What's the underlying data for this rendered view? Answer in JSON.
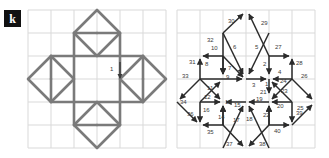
{
  "panel": {
    "label": "k"
  },
  "colors": {
    "grid_line": "#d9d9d9",
    "pattern_stroke": "#7a7a7a",
    "arrow_stroke": "#2b2b2b",
    "label_text": "#3a3a3a",
    "panel_badge_bg": "#111111",
    "panel_badge_text": "#ffffff",
    "background": "#ffffff"
  },
  "left_figure": {
    "name": "octagram-rosette-pattern",
    "description": "Eight-pointed star rosette drawn on a six-by-six square grid",
    "grid": {
      "cols": 6,
      "rows": 6,
      "cell_px": 23,
      "origin_x": 28,
      "origin_y": 10
    },
    "annotation_labels": [
      "1"
    ]
  },
  "right_figure": {
    "name": "numbered-stroke-order-diagram",
    "description": "Same rosette decomposed into 40 numbered directional strokes",
    "grid": {
      "cols": 6,
      "rows": 6,
      "cell_px": 23,
      "origin_x": 177,
      "origin_y": 10
    },
    "stroke_count": 40,
    "stroke_labels": [
      "1",
      "2",
      "3",
      "4",
      "5",
      "6",
      "7",
      "8",
      "9",
      "10",
      "11",
      "12",
      "13",
      "14",
      "15",
      "16",
      "17",
      "18",
      "19",
      "20",
      "21",
      "22",
      "23",
      "24",
      "25",
      "26",
      "27",
      "28",
      "29",
      "30",
      "31",
      "32",
      "33",
      "34",
      "35",
      "36",
      "37",
      "38",
      "39",
      "40"
    ]
  }
}
